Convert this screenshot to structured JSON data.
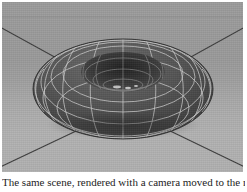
{
  "figure": {
    "medium": "3d-render-screenshot",
    "caption": "The same scene, rendered with a camera moved to the right."
  },
  "viewport": {
    "name": "3d-render-viewport",
    "background_color": "#9a9a9a",
    "floor_color": "#a6a6a6",
    "grid_line_color": "#3c3c3c"
  },
  "scene": {
    "object": {
      "name": "torus",
      "shading": "flat-shaded-with-wireframe",
      "surface_color": "#4f4f4f",
      "wireframe_color": "#c9c9c9",
      "major_segments": 24,
      "minor_segments": 12,
      "center_x": 121,
      "center_y": 88
    },
    "ground": {
      "name": "ground-plane",
      "grid_lines": 4,
      "grid_pattern": "diagonals-radiating-to-corners"
    },
    "shadow": {
      "name": "contact-shadow",
      "color": "#2f2f2f"
    }
  }
}
